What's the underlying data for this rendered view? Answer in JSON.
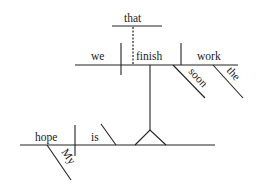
{
  "diagram": {
    "type": "sentence-diagram",
    "sentence": "My hope is that we finish the work soon",
    "main_clause": {
      "subject": "hope",
      "subject_modifier": "My",
      "verb": "is",
      "predicate_nominative": "noun clause"
    },
    "noun_clause": {
      "conjunction": "that",
      "subject": "we",
      "verb": "finish",
      "direct_object": "work",
      "adverb_modifier": "soon",
      "object_modifier": "the"
    },
    "words": {
      "that": "that",
      "we": "we",
      "finish": "finish",
      "work": "work",
      "soon": "soon",
      "the": "the",
      "hope": "hope",
      "is": "is",
      "my": "My"
    }
  }
}
